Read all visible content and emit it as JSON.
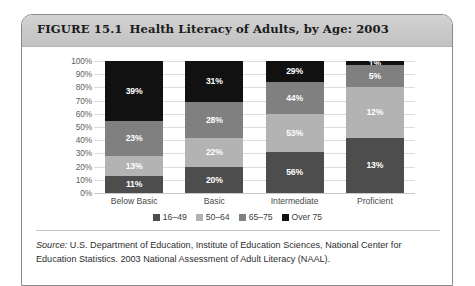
{
  "figure": {
    "number": "FIGURE 15.1",
    "title": "Health Literacy of Adults, by Age: 2003",
    "source_label": "Source:",
    "source_text": " U.S. Department of Education, Institute of Education Sciences, National Center for Education Statistics. 2003 National Assessment of Adult Literacy (NAAL)."
  },
  "chart_data": {
    "type": "bar",
    "title": "Health Literacy of Adults, by Age: 2003",
    "xlabel": "",
    "ylabel": "",
    "ylim": [
      0,
      100
    ],
    "grid": true,
    "stacked": true,
    "legend_position": "bottom",
    "categories": [
      "Below Basic",
      "Basic",
      "Intermediate",
      "Proficient"
    ],
    "tick_labels": [
      "100%",
      "90%",
      "80%",
      "70%",
      "60%",
      "50%",
      "40%",
      "30%",
      "20%",
      "10%",
      "0%"
    ],
    "series": [
      {
        "name": "16–49",
        "color": "#4d4d4d",
        "values": [
          11,
          20,
          56,
          13
        ],
        "labels": [
          "11%",
          "20%",
          "56%",
          "13%"
        ]
      },
      {
        "name": "50–64",
        "color": "#b3b3b3",
        "values": [
          13,
          22,
          53,
          12
        ],
        "labels": [
          "13%",
          "22%",
          "53%",
          "12%"
        ]
      },
      {
        "name": "65–75",
        "color": "#808080",
        "values": [
          23,
          28,
          44,
          5
        ],
        "labels": [
          "23%",
          "28%",
          "44%",
          "5%"
        ]
      },
      {
        "name": "Over 75",
        "color": "#111111",
        "values": [
          39,
          31,
          29,
          1
        ],
        "labels": [
          "39%",
          "31%",
          "29%",
          "1%"
        ]
      }
    ]
  }
}
